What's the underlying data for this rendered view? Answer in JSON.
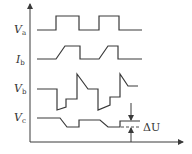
{
  "diagram": {
    "type": "timing-waveform",
    "signals": [
      {
        "id": "va",
        "label": "V",
        "subscript": "a",
        "label_y": 33
      },
      {
        "id": "ib",
        "label": "I",
        "subscript": "b",
        "label_y": 63
      },
      {
        "id": "vb",
        "label": "V",
        "subscript": "b",
        "label_y": 92
      },
      {
        "id": "vc",
        "label": "V",
        "subscript": "c",
        "label_y": 121
      }
    ],
    "annotation": {
      "label": "ΔU"
    },
    "colors": {
      "stroke": "#3a3a3a",
      "text": "#333333",
      "background": "#ffffff"
    }
  }
}
